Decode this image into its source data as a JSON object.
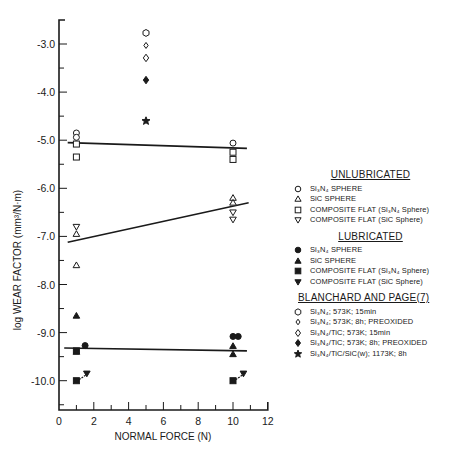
{
  "chart_data": {
    "type": "scatter",
    "title": "",
    "xlabel": "NORMAL FORCE (N)",
    "ylabel": "log WEAR FACTOR (mm³/N·m)",
    "xlim": [
      0,
      12
    ],
    "ylim": [
      -10.6,
      -2.5
    ],
    "x_ticks": [
      0,
      2,
      4,
      6,
      8,
      10,
      12
    ],
    "x_tick_labels": [
      "0",
      "2",
      "4",
      "6",
      "8",
      "10",
      "12"
    ],
    "y_ticks": [
      -3.0,
      -4.0,
      -5.0,
      -6.0,
      -7.0,
      -8.0,
      -9.0,
      -10.0
    ],
    "y_tick_labels": [
      "-3.0",
      "-4.0",
      "-5.0",
      "-6.0",
      "-7.0",
      "-8.0",
      "-9.0",
      "-10.0"
    ],
    "grid": false,
    "legend_position": "right",
    "series": [
      {
        "name": "Si3N4 SPHERE",
        "group": "UNLUBRICATED",
        "marker": "circle-open",
        "points": [
          [
            1,
            -4.85
          ],
          [
            1,
            -4.94
          ],
          [
            10,
            -5.06
          ]
        ]
      },
      {
        "name": "SiC SPHERE",
        "group": "UNLUBRICATED",
        "marker": "triangle-up-open",
        "points": [
          [
            1,
            -6.95
          ],
          [
            1,
            -7.6
          ],
          [
            10,
            -6.2
          ],
          [
            10,
            -6.3
          ]
        ]
      },
      {
        "name": "COMPOSITE FLAT (Si3N4 Sphere)",
        "group": "UNLUBRICATED",
        "marker": "square-open",
        "points": [
          [
            1,
            -5.08
          ],
          [
            1,
            -5.35
          ],
          [
            10,
            -5.25
          ],
          [
            10,
            -5.4
          ]
        ]
      },
      {
        "name": "COMPOSITE FLAT (SiC Sphere)",
        "group": "UNLUBRICATED",
        "marker": "triangle-down-open",
        "points": [
          [
            1,
            -6.8
          ],
          [
            10,
            -6.5
          ],
          [
            10,
            -6.65
          ]
        ]
      },
      {
        "name": "Si3N4 SPHERE",
        "group": "LUBRICATED",
        "marker": "circle-filled",
        "points": [
          [
            1.5,
            -9.27
          ],
          [
            10,
            -9.08
          ],
          [
            10.3,
            -9.08
          ]
        ]
      },
      {
        "name": "SiC SPHERE",
        "group": "LUBRICATED",
        "marker": "triangle-up-filled",
        "points": [
          [
            1,
            -8.65
          ],
          [
            1,
            -9.4
          ],
          [
            10,
            -9.28
          ],
          [
            10,
            -9.45
          ]
        ]
      },
      {
        "name": "COMPOSITE FLAT (Si3N4 Sphere)",
        "group": "LUBRICATED",
        "marker": "square-filled",
        "points": [
          [
            1,
            -9.38
          ],
          [
            1,
            -10.0
          ],
          [
            10,
            -10.0
          ]
        ]
      },
      {
        "name": "COMPOSITE FLAT (SiC Sphere)",
        "group": "LUBRICATED",
        "marker": "triangle-down-filled",
        "points": [
          [
            1.6,
            -9.85
          ],
          [
            10.6,
            -9.85
          ]
        ]
      },
      {
        "name": "Si3N4; 573K; 15min",
        "group": "BLANCHARD AND PAGE(7)",
        "marker": "hexagon-open",
        "points": [
          [
            5,
            -2.77
          ]
        ]
      },
      {
        "name": "Si3N4; 573K; 8h; PREOXIDED",
        "group": "BLANCHARD AND PAGE(7)",
        "marker": "diamond-open-small",
        "points": [
          [
            5,
            -3.03
          ]
        ]
      },
      {
        "name": "Si3N4/TiC; 573K; 15min",
        "group": "BLANCHARD AND PAGE(7)",
        "marker": "diamond-open",
        "points": [
          [
            5,
            -3.29
          ]
        ]
      },
      {
        "name": "Si3N4/TiC; 573K; 8h; PREOXIDED",
        "group": "BLANCHARD AND PAGE(7)",
        "marker": "diamond-filled",
        "points": [
          [
            5,
            -3.75
          ]
        ]
      },
      {
        "name": "Si3N4/TiC/SiC(w); 1173K; 8h",
        "group": "BLANCHARD AND PAGE(7)",
        "marker": "star-filled",
        "points": [
          [
            5,
            -4.6
          ]
        ]
      }
    ],
    "fit_lines": [
      {
        "name": "Unlubricated Si3N4 fit",
        "from": [
          0.5,
          -5.05
        ],
        "to": [
          10.8,
          -5.17
        ]
      },
      {
        "name": "Unlubricated SiC fit",
        "from": [
          0.5,
          -7.12
        ],
        "to": [
          10.9,
          -6.3
        ]
      },
      {
        "name": "Lubricated fit",
        "from": [
          0.3,
          -9.32
        ],
        "to": [
          10.8,
          -9.38
        ]
      }
    ]
  },
  "legend": {
    "unlubricated": {
      "header": "UNLUBRICATED",
      "items": [
        {
          "symbol": "circle-open",
          "label": "Si₃N₄ SPHERE"
        },
        {
          "symbol": "triangle-up-open",
          "label": "SiC SPHERE"
        },
        {
          "symbol": "square-open",
          "label": "COMPOSITE FLAT (Si₃N₄ Sphere)"
        },
        {
          "symbol": "triangle-down-open",
          "label": "COMPOSITE FLAT (SiC Sphere)"
        }
      ]
    },
    "lubricated": {
      "header": "LUBRICATED",
      "items": [
        {
          "symbol": "circle-filled",
          "label": "Si₃N₄ SPHERE"
        },
        {
          "symbol": "triangle-up-filled",
          "label": "SiC SPHERE"
        },
        {
          "symbol": "square-filled",
          "label": "COMPOSITE FLAT (Si₃N₄ Sphere)"
        },
        {
          "symbol": "triangle-down-filled",
          "label": "COMPOSITE FLAT (SiC Sphere)"
        }
      ]
    },
    "blanchard": {
      "header": "BLANCHARD AND PAGE(7)",
      "items": [
        {
          "symbol": "hexagon-open",
          "label": "Si₃N₄; 573K; 15min"
        },
        {
          "symbol": "diamond-open-small",
          "label": "Si₃N₄; 573K; 8h; PREOXIDED"
        },
        {
          "symbol": "diamond-open",
          "label": "Si₃N₄/TiC; 573K; 15min"
        },
        {
          "symbol": "diamond-filled",
          "label": "Si₃N₄/TiC; 573K; 8h; PREOXIDED"
        },
        {
          "symbol": "star-filled",
          "label": "Si₃N₄/TiC/SiC(w); 1173K; 8h"
        }
      ]
    }
  }
}
